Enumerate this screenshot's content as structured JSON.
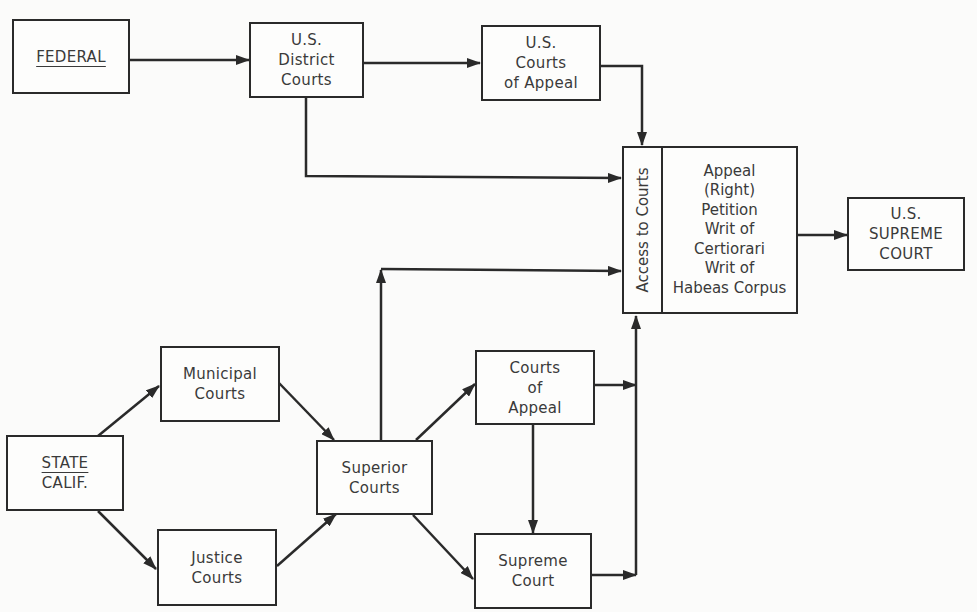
{
  "diagram": {
    "type": "flowchart",
    "colors": {
      "background": "#fbfbfa",
      "stroke": "#2a2a2a",
      "text": "#3a3a3a"
    },
    "nodes": {
      "federal": {
        "label": "FEDERAL"
      },
      "us_district": {
        "lines": [
          "U.S.",
          "District",
          "Courts"
        ]
      },
      "us_appeal": {
        "lines": [
          "U.S.",
          "Courts",
          "of Appeal"
        ]
      },
      "access": {
        "side_label": "Access to Courts",
        "lines": [
          "Appeal",
          "(Right)",
          "Petition",
          "Writ of",
          "Certiorari",
          "Writ of",
          "Habeas Corpus"
        ]
      },
      "us_supreme": {
        "lines": [
          "U.S.",
          "SUPREME",
          "COURT"
        ]
      },
      "state": {
        "line1": "STATE",
        "line2": "CALIF."
      },
      "municipal": {
        "lines": [
          "Municipal",
          "Courts"
        ]
      },
      "justice": {
        "lines": [
          "Justice",
          "Courts"
        ]
      },
      "superior": {
        "lines": [
          "Superior",
          "Courts"
        ]
      },
      "ca_appeal": {
        "lines": [
          "Courts",
          "of",
          "Appeal"
        ]
      },
      "ca_supreme": {
        "lines": [
          "Supreme",
          "Court"
        ]
      }
    },
    "edges": [
      {
        "from": "FEDERAL",
        "to": "U.S. District Courts"
      },
      {
        "from": "U.S. District Courts",
        "to": "U.S. Courts of Appeal"
      },
      {
        "from": "U.S. District Courts",
        "to": "Access to Courts"
      },
      {
        "from": "U.S. Courts of Appeal",
        "to": "Access to Courts"
      },
      {
        "from": "Access to Courts",
        "to": "U.S. SUPREME COURT"
      },
      {
        "from": "STATE CALIF.",
        "to": "Municipal Courts"
      },
      {
        "from": "STATE CALIF.",
        "to": "Justice Courts"
      },
      {
        "from": "Municipal Courts",
        "to": "Superior Courts"
      },
      {
        "from": "Justice Courts",
        "to": "Superior Courts"
      },
      {
        "from": "Superior Courts",
        "to": "Access to Courts"
      },
      {
        "from": "Superior Courts",
        "to": "Courts of Appeal"
      },
      {
        "from": "Superior Courts",
        "to": "Supreme Court"
      },
      {
        "from": "Courts of Appeal",
        "to": "Supreme Court"
      },
      {
        "from": "Courts of Appeal",
        "to": "Access to Courts"
      },
      {
        "from": "Supreme Court",
        "to": "Access to Courts"
      }
    ]
  }
}
